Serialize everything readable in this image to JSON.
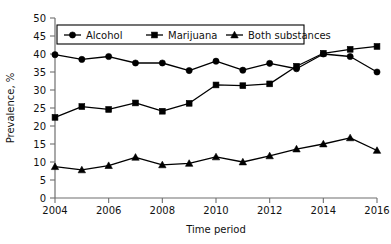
{
  "chart_data": {
    "type": "line",
    "title": "",
    "subtitle": "",
    "xlabel": "Time period",
    "ylabel": "Prevalence, %",
    "x": [
      2004,
      2005,
      2006,
      2007,
      2008,
      2009,
      2010,
      2011,
      2012,
      2013,
      2014,
      2015,
      2016
    ],
    "categories": [
      "2004",
      "2005",
      "2006",
      "2007",
      "2008",
      "2009",
      "2010",
      "2011",
      "2012",
      "2013",
      "2014",
      "2015",
      "2016"
    ],
    "xtick_labels": [
      "2004",
      "2006",
      "2008",
      "2010",
      "2012",
      "2014",
      "2016"
    ],
    "xtick_values": [
      2004,
      2006,
      2008,
      2010,
      2012,
      2014,
      2016
    ],
    "ytick_labels": [
      "0",
      "5",
      "10",
      "15",
      "20",
      "25",
      "30",
      "35",
      "40",
      "45",
      "50"
    ],
    "ytick_values": [
      0,
      5,
      10,
      15,
      20,
      25,
      30,
      35,
      40,
      45,
      50
    ],
    "xlim": [
      2004,
      2016
    ],
    "ylim": [
      0,
      50
    ],
    "grid": false,
    "legend_position": "top-center",
    "series": [
      {
        "name": "Alcohol",
        "marker": "circle",
        "color": "#000000",
        "values": [
          39.8,
          38.5,
          39.3,
          37.5,
          37.5,
          35.4,
          38.0,
          35.5,
          37.4,
          35.9,
          40.0,
          39.3,
          35.0
        ]
      },
      {
        "name": "Marijuana",
        "marker": "square",
        "color": "#000000",
        "values": [
          22.4,
          25.4,
          24.6,
          26.4,
          24.1,
          26.3,
          31.4,
          31.2,
          31.7,
          36.6,
          40.2,
          41.3,
          42.1
        ]
      },
      {
        "name": "Both substances",
        "marker": "triangle",
        "color": "#000000",
        "values": [
          8.7,
          7.8,
          9.0,
          11.3,
          9.2,
          9.6,
          11.4,
          10.0,
          11.7,
          13.6,
          15.0,
          16.7,
          13.2
        ]
      }
    ]
  },
  "axes": {
    "x_title": "Time period",
    "y_title": "Prevalence, %"
  },
  "legend": {
    "entries": [
      {
        "label": "Alcohol",
        "marker": "circle-marker-icon"
      },
      {
        "label": "Marijuana",
        "marker": "square-marker-icon"
      },
      {
        "label": "Both substances",
        "marker": "triangle-marker-icon"
      }
    ]
  },
  "colors": {
    "ink": "#000000",
    "axis": "#6f6f6f",
    "background": "#ffffff"
  }
}
